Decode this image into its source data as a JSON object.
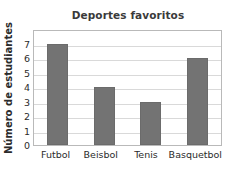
{
  "chart_data": {
    "type": "bar",
    "title": "Deportes favoritos",
    "xlabel": "",
    "ylabel": "Número de estudiantes",
    "categories": [
      "Futbol",
      "Beisbol",
      "Tenis",
      "Basquetbol"
    ],
    "values": [
      7,
      4,
      3,
      6
    ],
    "ylim": [
      0,
      8
    ],
    "yticks": [
      7,
      6,
      5,
      4,
      3,
      2,
      1,
      0
    ],
    "grid": true,
    "legend": false,
    "bar_color": "#737373",
    "gridline_color": "#d9d9d9",
    "axis_color": "#b9b9b9",
    "background_color": "#ffffff",
    "text_color": "#2b2b2b"
  }
}
